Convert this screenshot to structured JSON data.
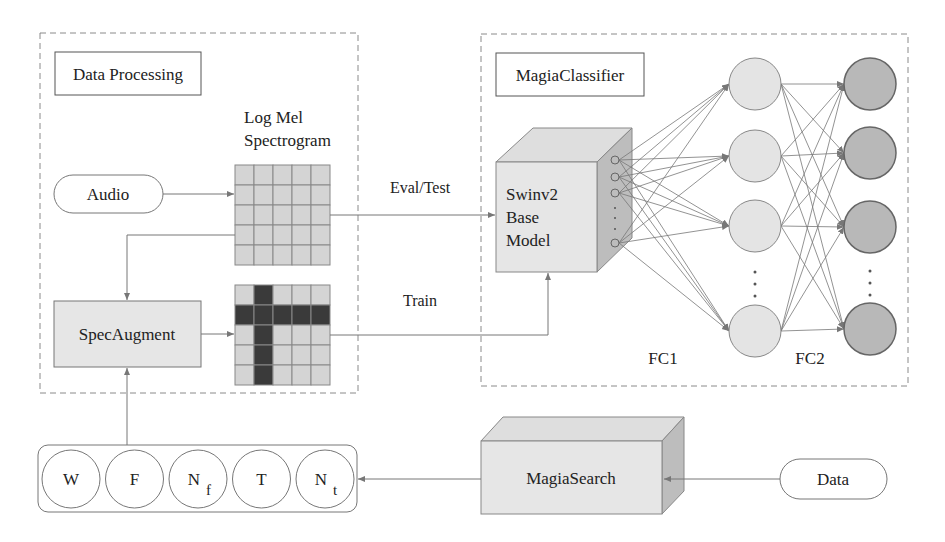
{
  "colors": {
    "line": "#777777",
    "dashed": "#8a8a8a",
    "box_fill": "#e6e6e6",
    "cube_top": "#dedede",
    "cube_side": "#bdbdbd",
    "cell_fill": "#d4d4d4",
    "cell_mask": "#3a3a3a",
    "fc1_fill": "#e4e4e4",
    "fc2_fill": "#b8b8b8"
  },
  "data_processing": {
    "title": "Data Processing",
    "audio_label": "Audio",
    "spectrogram_title_line1": "Log Mel",
    "spectrogram_title_line2": "Spectrogram",
    "specaugment_label": "SpecAugment",
    "grid": {
      "rows": 5,
      "cols": 5,
      "masked_row": 1,
      "masked_col": 1
    }
  },
  "edges": {
    "eval_label": "Eval/Test",
    "train_label": "Train"
  },
  "classifier": {
    "title": "MagiaClassifier",
    "model_line1": "Swinv2",
    "model_line2": "Base",
    "model_line3": "Model",
    "fc1_label": "FC1",
    "fc2_label": "FC2",
    "ellipsis": "⋮"
  },
  "search": {
    "label": "MagiaSearch",
    "data_label": "Data",
    "params": [
      {
        "main": "W",
        "sub": ""
      },
      {
        "main": "F",
        "sub": ""
      },
      {
        "main": "N",
        "sub": "f"
      },
      {
        "main": "T",
        "sub": ""
      },
      {
        "main": "N",
        "sub": "t"
      }
    ]
  }
}
